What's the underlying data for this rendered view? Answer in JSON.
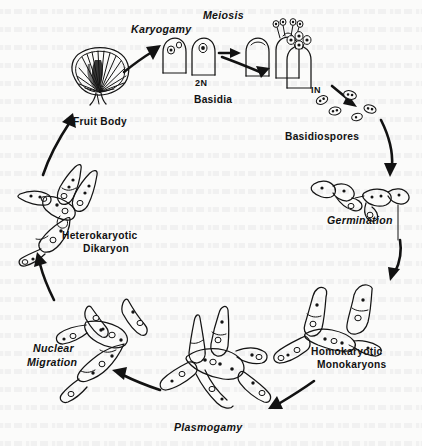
{
  "figure": {
    "name": "basidiomycete-life-cycle",
    "background_color": "#fbfbfa",
    "ink_color": "#141414"
  },
  "labels": {
    "karyogamy": "Karyogamy",
    "meiosis": "Meiosis",
    "ploidy_diploid": "2N",
    "basidia": "Basidia",
    "ploidy_haploid": "IN",
    "basidiospores": "Basidiospores",
    "germination": "Germination",
    "homokaryotic": "Homokaryotic",
    "monokaryons": "Monokaryons",
    "plasmogamy": "Plasmogamy",
    "nuclear_migration_line1": "Nuclear",
    "nuclear_migration_line2": "Migration",
    "heterokaryotic": "Heterokaryotic",
    "dikaryon": "Dikaryon",
    "fruit_body": "Fruit Body"
  },
  "stages": [
    {
      "id": "fruit-body",
      "label": "Fruit Body",
      "style": "upright",
      "position": "left-top"
    },
    {
      "id": "karyogamy",
      "label": "Karyogamy",
      "style": "italic",
      "position": "top-left"
    },
    {
      "id": "meiosis",
      "label": "Meiosis",
      "style": "italic",
      "position": "top-center"
    },
    {
      "id": "basidia",
      "label": "Basidia",
      "style": "upright",
      "position": "top-center-below"
    },
    {
      "id": "basidiospores",
      "label": "Basidiospores",
      "style": "upright",
      "position": "top-right"
    },
    {
      "id": "germination",
      "label": "Germination",
      "style": "italic",
      "position": "right"
    },
    {
      "id": "homokaryotic-monokaryons",
      "label": "Homokaryotic Monokaryons",
      "style": "upright",
      "position": "right-bottom"
    },
    {
      "id": "plasmogamy",
      "label": "Plasmogamy",
      "style": "italic",
      "position": "bottom-center"
    },
    {
      "id": "nuclear-migration",
      "label": "Nuclear Migration",
      "style": "italic",
      "position": "left-bottom"
    },
    {
      "id": "heterokaryotic-dikaryon",
      "label": "Heterokaryotic Dikaryon",
      "style": "upright",
      "position": "left"
    }
  ],
  "ploidy_annotations": [
    {
      "id": "diploid",
      "text": "2N",
      "near": "karyogamy"
    },
    {
      "id": "haploid",
      "text": "IN",
      "near": "basidiospores"
    }
  ]
}
